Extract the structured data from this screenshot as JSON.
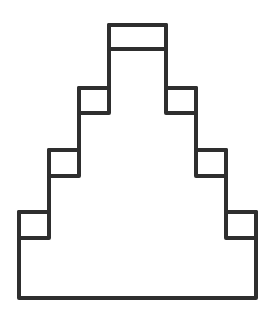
{
  "diagram": {
    "stroke_color": "#2e2e2e",
    "background_color": "#ffffff",
    "stroke_width": 4,
    "outline_points": [
      [
        19,
        298
      ],
      [
        19,
        212
      ],
      [
        49,
        212
      ],
      [
        49,
        150
      ],
      [
        79,
        150
      ],
      [
        79,
        88
      ],
      [
        109,
        88
      ],
      [
        109,
        25
      ],
      [
        166,
        25
      ],
      [
        166,
        88
      ],
      [
        196,
        88
      ],
      [
        196,
        150
      ],
      [
        226,
        150
      ],
      [
        226,
        212
      ],
      [
        256,
        212
      ],
      [
        256,
        298
      ]
    ],
    "step_boxes": [
      {
        "name": "top-cap",
        "x": 109,
        "y": 25,
        "w": 57,
        "h": 24
      },
      {
        "name": "tier2-left-step",
        "x": 79,
        "y": 88,
        "w": 30,
        "h": 25
      },
      {
        "name": "tier2-right-step",
        "x": 166,
        "y": 88,
        "w": 30,
        "h": 25
      },
      {
        "name": "tier3-left-step",
        "x": 49,
        "y": 150,
        "w": 30,
        "h": 26
      },
      {
        "name": "tier3-right-step",
        "x": 196,
        "y": 150,
        "w": 30,
        "h": 26
      },
      {
        "name": "tier4-left-step",
        "x": 19,
        "y": 212,
        "w": 30,
        "h": 26
      },
      {
        "name": "tier4-right-step",
        "x": 226,
        "y": 212,
        "w": 30,
        "h": 26
      }
    ]
  }
}
